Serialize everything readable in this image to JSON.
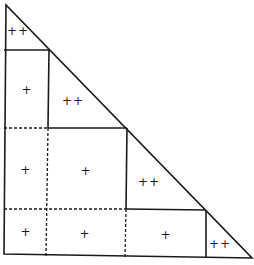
{
  "diagram": {
    "colors": {
      "stroke": "#1a1a1a",
      "background": "#ffffff"
    },
    "outline": {
      "apex": [
        6,
        5
      ],
      "bottom_left": [
        4,
        254
      ],
      "bottom_right": [
        252,
        258
      ]
    },
    "solid_segments": [
      {
        "from": [
          4,
          50
        ],
        "to": [
          49,
          50
        ]
      },
      {
        "from": [
          49,
          50
        ],
        "to": [
          48,
          128
        ]
      },
      {
        "from": [
          48,
          128
        ],
        "to": [
          127,
          128
        ]
      },
      {
        "from": [
          127,
          128
        ],
        "to": [
          126,
          209
        ]
      },
      {
        "from": [
          126,
          209
        ],
        "to": [
          206,
          210
        ]
      },
      {
        "from": [
          206,
          210
        ],
        "to": [
          206,
          257
        ]
      }
    ],
    "dashed_segments": [
      {
        "from": [
          4,
          128
        ],
        "to": [
          48,
          128
        ]
      },
      {
        "from": [
          48,
          128
        ],
        "to": [
          46,
          256
        ]
      },
      {
        "from": [
          4,
          209
        ],
        "to": [
          126,
          209
        ]
      },
      {
        "from": [
          126,
          209
        ],
        "to": [
          125,
          257
        ]
      }
    ],
    "labels": [
      {
        "text": "++",
        "x": 18,
        "y": 31
      },
      {
        "text": "+",
        "x": 27,
        "y": 90
      },
      {
        "text": "++",
        "x": 73,
        "y": 101
      },
      {
        "text": "+",
        "x": 26,
        "y": 170
      },
      {
        "text": "+",
        "x": 86,
        "y": 171
      },
      {
        "text": "++",
        "x": 149,
        "y": 182
      },
      {
        "text": "+",
        "x": 26,
        "y": 232
      },
      {
        "text": "+",
        "x": 85,
        "y": 234
      },
      {
        "text": "+",
        "x": 166,
        "y": 235
      },
      {
        "text": "++",
        "x": 220,
        "y": 244
      }
    ]
  }
}
